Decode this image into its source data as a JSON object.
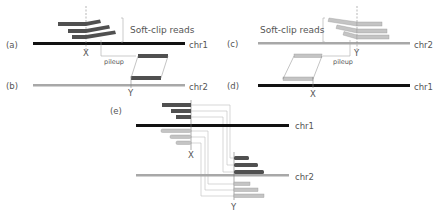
{
  "colors": {
    "chr1": "#111111",
    "chr2": "#a8a8a8",
    "dark_read": "#505050",
    "light_read": "#c4c4c4",
    "connector": "#bdbdbd",
    "text": "#555555"
  },
  "panels": {
    "a": {
      "label": "(a)",
      "chromosome": "chr1",
      "breakpoint": "X",
      "annotation": "Soft-clip reads",
      "pileup_label": "pileup"
    },
    "b": {
      "label": "(b)",
      "chromosome": "chr2",
      "breakpoint": "Y"
    },
    "c": {
      "label": "(c)",
      "chromosome": "chr2",
      "breakpoint": "Y",
      "annotation": "Soft-clip reads",
      "pileup_label": "pileup"
    },
    "d": {
      "label": "(d)",
      "chromosome": "chr1",
      "breakpoint": "X"
    },
    "e": {
      "label": "(e)",
      "chromosome_top": "chr1",
      "chromosome_bottom": "chr2",
      "breakpoint_top": "X",
      "breakpoint_bottom": "Y"
    }
  }
}
